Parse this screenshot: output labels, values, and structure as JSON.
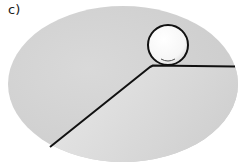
{
  "figure": {
    "label": "c)",
    "colors": {
      "background_ellipse": "#d4d4d4",
      "shadow_region": "#c4c4c4",
      "line": "#111111",
      "ball_fill": "#ffffff",
      "ball_stroke": "#111111"
    }
  }
}
